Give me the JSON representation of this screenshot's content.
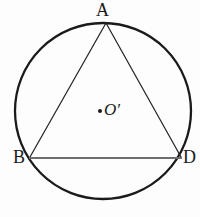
{
  "figure": {
    "name": "circumscribed-triangle-diagram",
    "background_color": "#fdfdfd",
    "stroke_color": "#1a1a1a",
    "chord_color": "#6e6e6e",
    "circle": {
      "center_x": 103,
      "center_y": 111,
      "radius": 88,
      "stroke_width": 2.2
    },
    "triangle": {
      "stroke_width": 1.2,
      "vertices": [
        {
          "id": "A",
          "x": 106,
          "y": 23
        },
        {
          "id": "B",
          "x": 30,
          "y": 157
        },
        {
          "id": "D",
          "x": 181,
          "y": 157
        }
      ],
      "sides": [
        {
          "from": "A",
          "to": "B"
        },
        {
          "from": "A",
          "to": "D"
        },
        {
          "from": "B",
          "to": "D"
        }
      ]
    },
    "center_marker": {
      "x": 100,
      "y": 111,
      "radius": 2
    },
    "labels": {
      "vertex_a": "A",
      "vertex_b": "B",
      "vertex_d": "D",
      "center": "O′"
    }
  }
}
